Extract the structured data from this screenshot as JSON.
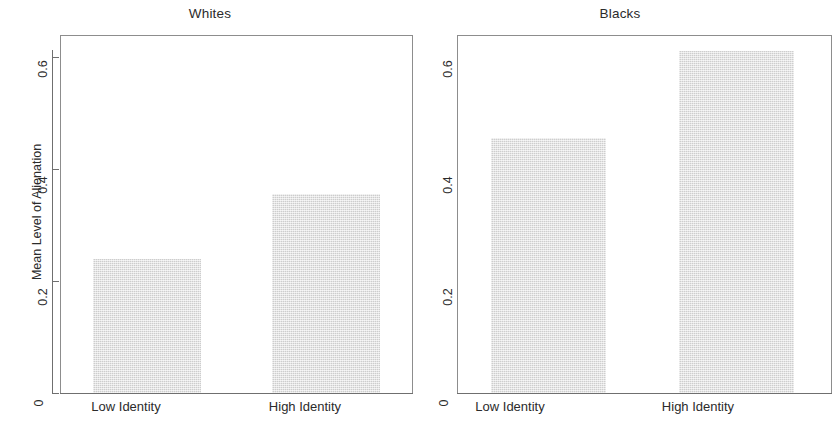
{
  "chart_data": {
    "type": "bar",
    "title": "",
    "xlabel": "",
    "ylabel": "Mean Level of Alienation",
    "ylim": [
      0,
      0.655
    ],
    "yticks": [
      0,
      0.2,
      0.4,
      0.6
    ],
    "ytick_labels": [
      "0",
      "0.2",
      "0.4",
      "0.6"
    ],
    "grid": false,
    "legend": "none",
    "categories": [
      "Low Identity",
      "High Identity"
    ],
    "panels": [
      {
        "title": "Whites",
        "categories": [
          "Low Identity",
          "High Identity"
        ],
        "values": [
          0.24,
          0.355
        ]
      },
      {
        "title": "Blacks",
        "categories": [
          "Low Identity",
          "High Identity"
        ],
        "values": [
          0.455,
          0.61
        ]
      }
    ],
    "series": [
      {
        "name": "Whites",
        "values": [
          0.24,
          0.355
        ]
      },
      {
        "name": "Blacks",
        "values": [
          0.455,
          0.61
        ]
      }
    ],
    "bar_color": "#dcdcdc",
    "axis_color": "#6f6f6f"
  },
  "panel_left": {
    "title": "Whites",
    "y_axis_title": "Mean Level of Alienation",
    "yticks": [
      "0.6",
      "0.4",
      "0.2",
      "0"
    ],
    "bars": [
      {
        "label": "Low Identity",
        "value": 0.24
      },
      {
        "label": "High Identity",
        "value": 0.355
      }
    ]
  },
  "panel_right": {
    "title": "Blacks",
    "yticks": [
      "0.6",
      "0.4",
      "0.2",
      "0"
    ],
    "bars": [
      {
        "label": "Low Identity",
        "value": 0.455
      },
      {
        "label": "High Identity",
        "value": 0.61
      }
    ]
  }
}
